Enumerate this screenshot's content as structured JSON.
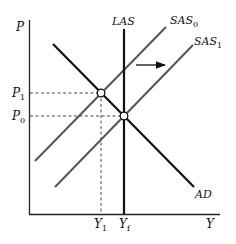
{
  "diagram": {
    "type": "AD-AS model",
    "axes": {
      "y_label": "P",
      "x_label": "Y"
    },
    "curves": {
      "las": {
        "label": "LAS",
        "color": "#111111"
      },
      "sas0": {
        "label": "SAS",
        "subscript": "0",
        "color": "#555555"
      },
      "sas1": {
        "label": "SAS",
        "subscript": "1",
        "color": "#555555"
      },
      "ad": {
        "label": "AD",
        "color": "#111111"
      }
    },
    "price_levels": [
      {
        "label": "P",
        "subscript": "1"
      },
      {
        "label": "P",
        "subscript": "0"
      }
    ],
    "output_levels": [
      {
        "label": "Y",
        "subscript": "1"
      },
      {
        "label": "Y",
        "subscript": "f"
      }
    ],
    "shift_arrow": {
      "direction": "right"
    },
    "equilibria": [
      {
        "name": "E1",
        "price": "P1",
        "output": "Y1"
      },
      {
        "name": "E0",
        "price": "P0",
        "output": "Yf"
      }
    ]
  }
}
